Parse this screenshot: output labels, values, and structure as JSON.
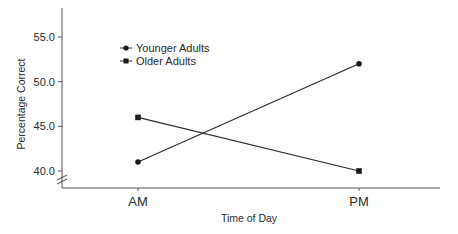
{
  "chart_data": {
    "type": "line",
    "title": "",
    "xlabel": "Time of Day",
    "ylabel": "Percentage Correct",
    "categories": [
      "AM",
      "PM"
    ],
    "series": [
      {
        "name": "Younger Adults",
        "marker": "circle",
        "values": [
          41.0,
          52.0
        ]
      },
      {
        "name": "Older Adults",
        "marker": "square",
        "values": [
          46.0,
          40.0
        ]
      }
    ],
    "ylim": [
      39.3,
      57.5
    ],
    "yticks": [
      40.0,
      45.0,
      50.0,
      55.0
    ],
    "ytick_labels": [
      "40.0",
      "45.0",
      "50.0",
      "55.0"
    ],
    "axis_break": "y-axis below 40.0",
    "grid": false,
    "legend_position": "upper-left inside plot",
    "colors": {
      "line": "#2b2b2b",
      "axis": "#555555"
    }
  }
}
